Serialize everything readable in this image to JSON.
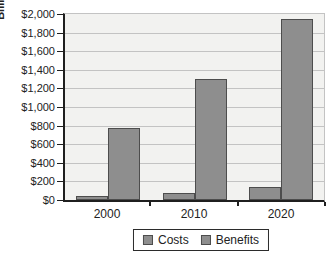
{
  "chart_data": {
    "type": "bar",
    "title": "",
    "xlabel": "",
    "ylabel": "Billions",
    "categories": [
      "2000",
      "2010",
      "2020"
    ],
    "series": [
      {
        "name": "Costs",
        "values": [
          40,
          70,
          140
        ]
      },
      {
        "name": "Benefits",
        "values": [
          775,
          1300,
          1950
        ]
      }
    ],
    "ylim": [
      0,
      2000
    ],
    "ytick_step": 200,
    "ytick_labels": [
      "$0",
      "$200",
      "$400",
      "$600",
      "$800",
      "$1,000",
      "$1,200",
      "$1,400",
      "$1,600",
      "$1,800",
      "$2,000"
    ],
    "grid": true,
    "legend_position": "bottom",
    "colors": {
      "bar_fill": "#8e8e8e",
      "bar_border": "#4d4d4d",
      "plot_bg": "#f2f2f0",
      "grid_line": "#c3c3c3",
      "axis_line": "#1f1f1f",
      "text": "#222222",
      "legend_border": "#2b2b2b",
      "background": "#ffffff"
    }
  }
}
